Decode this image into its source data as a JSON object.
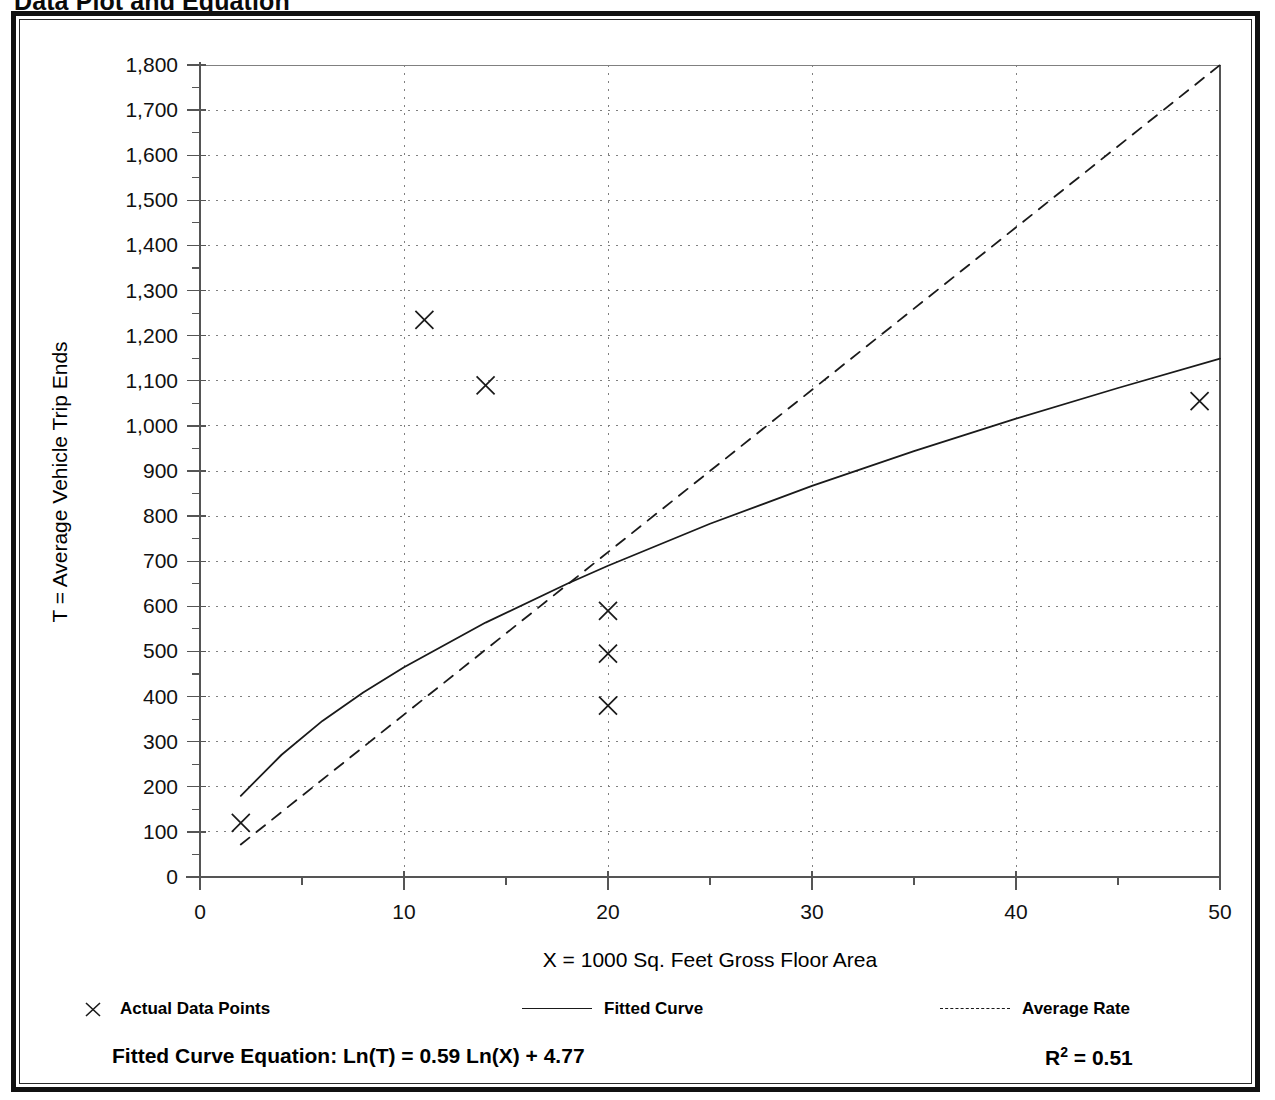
{
  "page": {
    "title": "Data Plot and Equation"
  },
  "legend": {
    "actual": {
      "label": "Actual Data Points",
      "marker": "x-marker-icon"
    },
    "fitted": {
      "label": "Fitted Curve",
      "marker": "solid-line-icon"
    },
    "average": {
      "label": "Average Rate",
      "marker": "dashed-line-icon"
    }
  },
  "footer": {
    "equation_label": "Fitted Curve Equation:",
    "equation": "Ln(T) = 0.59 Ln(X) + 4.77",
    "equation_full": "Fitted Curve Equation:  Ln(T) = 0.59 Ln(X) + 4.77",
    "r_squared_symbol": "R",
    "r_squared_exponent": "2",
    "r_squared_value": "= 0.51",
    "r_squared_full": "R2 = 0.51"
  },
  "chart_data": {
    "type": "scatter",
    "title": "Data Plot and Equation",
    "xlabel": "X = 1000 Sq. Feet Gross Floor Area",
    "ylabel": "T = Average Vehicle Trip Ends",
    "xlim": [
      0,
      50
    ],
    "ylim": [
      0,
      1800
    ],
    "xticks": [
      0,
      10,
      20,
      30,
      40,
      50
    ],
    "xtick_labels": [
      "0",
      "10",
      "20",
      "30",
      "40",
      "50"
    ],
    "xminor_step": 5,
    "yticks": [
      0,
      100,
      200,
      300,
      400,
      500,
      600,
      700,
      800,
      900,
      1000,
      1100,
      1200,
      1300,
      1400,
      1500,
      1600,
      1700,
      1800
    ],
    "ytick_labels": [
      "0",
      "100",
      "200",
      "300",
      "400",
      "500",
      "600",
      "700",
      "800",
      "900",
      "1,000",
      "1,100",
      "1,200",
      "1,300",
      "1,400",
      "1,500",
      "1,600",
      "1,700",
      "1,800"
    ],
    "yminor_step": 50,
    "grid": "dotted",
    "grid_color": "#808080",
    "axis_color": "#555555",
    "series_color": "#1a1a1a",
    "legend_position": "below-axis",
    "series": [
      {
        "name": "Actual Data Points",
        "type": "scatter",
        "marker": "x",
        "points": [
          {
            "x": 2,
            "y": 120
          },
          {
            "x": 11,
            "y": 1235
          },
          {
            "x": 14,
            "y": 1090
          },
          {
            "x": 20,
            "y": 590
          },
          {
            "x": 20,
            "y": 495
          },
          {
            "x": 20,
            "y": 380
          },
          {
            "x": 49,
            "y": 1055
          }
        ]
      },
      {
        "name": "Fitted Curve",
        "type": "line",
        "style": "solid",
        "equation": "Ln(T) = 0.59 Ln(X) + 4.77",
        "r_squared": 0.51,
        "x_range": [
          2,
          50
        ],
        "points": [
          {
            "x": 2,
            "y": 180
          },
          {
            "x": 4,
            "y": 271
          },
          {
            "x": 6,
            "y": 346
          },
          {
            "x": 8,
            "y": 409
          },
          {
            "x": 10,
            "y": 465
          },
          {
            "x": 14,
            "y": 564
          },
          {
            "x": 18,
            "y": 650
          },
          {
            "x": 20,
            "y": 690
          },
          {
            "x": 25,
            "y": 783
          },
          {
            "x": 30,
            "y": 867
          },
          {
            "x": 35,
            "y": 944
          },
          {
            "x": 40,
            "y": 1016
          },
          {
            "x": 45,
            "y": 1084
          },
          {
            "x": 50,
            "y": 1149
          }
        ]
      },
      {
        "name": "Average Rate",
        "type": "line",
        "style": "dashed",
        "slope": 36,
        "x_range": [
          2,
          50
        ],
        "points": [
          {
            "x": 2,
            "y": 72
          },
          {
            "x": 50,
            "y": 1800
          }
        ]
      }
    ]
  }
}
